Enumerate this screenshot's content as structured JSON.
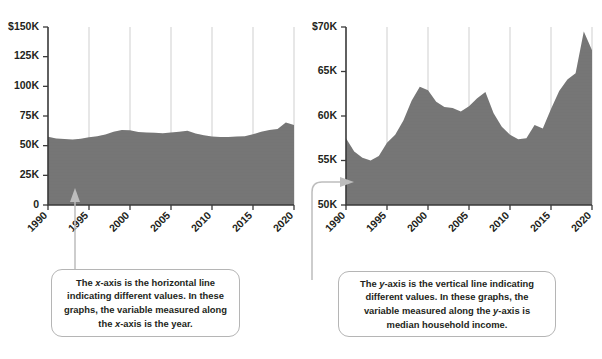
{
  "figure": {
    "background_color": "#ffffff",
    "area_color": "#757575",
    "axis_color": "#3a3a3a",
    "gridline_color": "#c9c9c9",
    "connector_color": "#bdbdbd"
  },
  "callouts": {
    "x_axis": {
      "name": "x-axis-callout",
      "text_parts": [
        {
          "t": "The ",
          "i": false
        },
        {
          "t": "x",
          "i": true
        },
        {
          "t": "-axis is the horizontal line indicating different values. In these graphs, the variable measured along the ",
          "i": false
        },
        {
          "t": "x",
          "i": true
        },
        {
          "t": "-axis is the year.",
          "i": false
        }
      ],
      "plain_text": "The x-axis is the horizontal line indicating different values. In these graphs, the variable measured along the x-axis is the year."
    },
    "y_axis": {
      "name": "y-axis-callout",
      "text_parts": [
        {
          "t": "The ",
          "i": false
        },
        {
          "t": "y",
          "i": true
        },
        {
          "t": "-axis is the vertical line indicating different values. In these graphs, the variable measured along the ",
          "i": false
        },
        {
          "t": "y",
          "i": true
        },
        {
          "t": "-axis is median household income.",
          "i": false
        }
      ],
      "plain_text": "The y-axis is the vertical line indicating different values. In these graphs, the variable measured along the y-axis is median household income."
    }
  },
  "chart_data": [
    {
      "id": "left-chart",
      "type": "area",
      "title": "",
      "xlabel": "",
      "ylabel": "",
      "xlim": [
        1990,
        2020
      ],
      "ylim": [
        0,
        150000
      ],
      "grid": "vertical",
      "legend": "none",
      "x_ticks": [
        1990,
        1995,
        2000,
        2005,
        2010,
        2015,
        2020
      ],
      "x_tick_labels": [
        "1990",
        "1995",
        "2000",
        "2005",
        "2010",
        "2015",
        "2020"
      ],
      "y_ticks": [
        0,
        25000,
        50000,
        75000,
        100000,
        125000,
        150000
      ],
      "y_tick_labels": [
        "0",
        "25K",
        "50K",
        "75K",
        "100K",
        "125K",
        "$150K"
      ],
      "series": [
        {
          "name": "Median household income",
          "x": [
            1990,
            1991,
            1992,
            1993,
            1994,
            1995,
            1996,
            1997,
            1998,
            1999,
            2000,
            2001,
            2002,
            2003,
            2004,
            2005,
            2006,
            2007,
            2008,
            2009,
            2010,
            2011,
            2012,
            2013,
            2014,
            2015,
            2016,
            2017,
            2018,
            2019,
            2020
          ],
          "values": [
            57500,
            56000,
            55600,
            55300,
            55800,
            57000,
            57900,
            59500,
            61700,
            63200,
            62900,
            61600,
            61000,
            60800,
            60400,
            61000,
            61800,
            62500,
            60200,
            58800,
            57700,
            57200,
            57300,
            57700,
            58000,
            59600,
            61700,
            63100,
            64100,
            69500,
            67500
          ]
        }
      ]
    },
    {
      "id": "right-chart",
      "type": "area",
      "title": "",
      "xlabel": "",
      "ylabel": "",
      "xlim": [
        1990,
        2020
      ],
      "ylim": [
        50000,
        70000
      ],
      "grid": "vertical",
      "legend": "none",
      "x_ticks": [
        1990,
        1995,
        2000,
        2005,
        2010,
        2015,
        2020
      ],
      "x_tick_labels": [
        "1990",
        "1995",
        "2000",
        "2005",
        "2010",
        "2015",
        "2020"
      ],
      "y_ticks": [
        50000,
        55000,
        60000,
        65000,
        70000
      ],
      "y_tick_labels": [
        "50K",
        "55K",
        "60K",
        "65K",
        "$70K"
      ],
      "series": [
        {
          "name": "Median household income",
          "x": [
            1990,
            1991,
            1992,
            1993,
            1994,
            1995,
            1996,
            1997,
            1998,
            1999,
            2000,
            2001,
            2002,
            2003,
            2004,
            2005,
            2006,
            2007,
            2008,
            2009,
            2010,
            2011,
            2012,
            2013,
            2014,
            2015,
            2016,
            2017,
            2018,
            2019,
            2020
          ],
          "values": [
            57500,
            56000,
            55300,
            55000,
            55500,
            57000,
            57900,
            59500,
            61700,
            63300,
            62900,
            61600,
            61000,
            60900,
            60500,
            61100,
            62000,
            62700,
            60300,
            58800,
            57900,
            57400,
            57500,
            59000,
            58600,
            60800,
            62800,
            64100,
            64800,
            69500,
            67400
          ]
        }
      ]
    }
  ]
}
